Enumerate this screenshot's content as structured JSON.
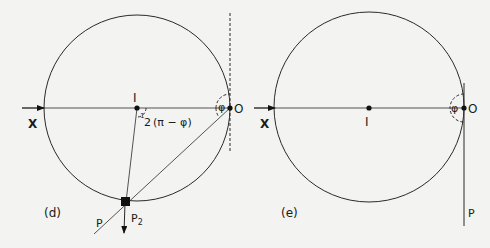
{
  "figure": {
    "panels": [
      {
        "id": "d",
        "label": "(d)",
        "points": {
          "X": "X",
          "I": "I",
          "O": "O",
          "P": "P",
          "P2_main": "P",
          "P2_sub": "2"
        },
        "angles": {
          "at_O": "φ",
          "at_I_frac_num": "1",
          "at_I_frac_den": "2",
          "at_I_expr": "(π − φ)"
        }
      },
      {
        "id": "e",
        "label": "(e)",
        "points": {
          "X": "X",
          "I": "I",
          "O": "O",
          "P": "P"
        },
        "angles": {
          "at_O": "φ"
        }
      }
    ],
    "colors": {
      "background": "#f3f3f1",
      "ink": "#1a1a1a"
    }
  }
}
